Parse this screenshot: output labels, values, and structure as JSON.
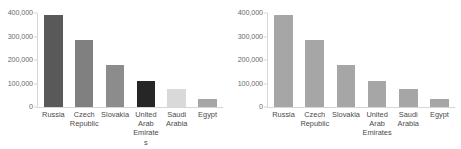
{
  "figure": {
    "background_color": "#ffffff",
    "axis_line_color": "#d6d6d6",
    "tick_label_color": "#6b6b6b",
    "category_label_color": "#4a4a4a"
  },
  "chart_data": [
    {
      "type": "bar",
      "id": "left-chart",
      "title": "",
      "xlabel": "",
      "ylabel": "",
      "categories": [
        "Russia",
        "Czech Republic",
        "Slovakia",
        "United Arab Emirates",
        "Saudi Arabia",
        "Egypt"
      ],
      "values": [
        390000,
        285000,
        180000,
        112000,
        75000,
        35000
      ],
      "bar_colors": [
        "#595959",
        "#808080",
        "#8c8c8c",
        "#262626",
        "#d9d9d9",
        "#a6a6a6"
      ],
      "ylim": [
        0,
        400000
      ],
      "yticks": [
        0,
        100000,
        200000,
        300000,
        400000
      ],
      "ytick_labels": [
        "0",
        "100,000",
        "200,000",
        "300,000",
        "400,000"
      ],
      "grid": false,
      "legend": "none"
    },
    {
      "type": "bar",
      "id": "right-chart",
      "title": "",
      "xlabel": "",
      "ylabel": "",
      "categories": [
        "Russia",
        "Czech Republic",
        "Slovakia",
        "United Arab Emirates",
        "Saudi Arabia",
        "Egypt"
      ],
      "values": [
        390000,
        285000,
        180000,
        112000,
        75000,
        35000
      ],
      "bar_colors": [
        "#a6a6a6",
        "#a6a6a6",
        "#a6a6a6",
        "#a6a6a6",
        "#a6a6a6",
        "#a6a6a6"
      ],
      "ylim": [
        0,
        400000
      ],
      "yticks": [
        0,
        100000,
        200000,
        300000,
        400000
      ],
      "ytick_labels": [
        "0",
        "100,000",
        "200,000",
        "300,000",
        "400,000"
      ],
      "grid": false,
      "legend": "none"
    }
  ]
}
